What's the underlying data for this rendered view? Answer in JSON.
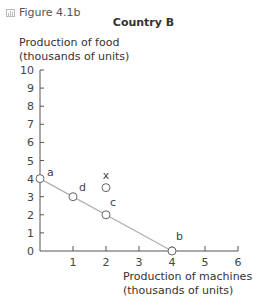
{
  "figure": {
    "label": "Figure 4.1b",
    "icon": "chart-icon"
  },
  "chart_data": {
    "type": "line",
    "title": "Country B",
    "ylabel": "Production of food\n(thousands of units)",
    "ylabel_lines": [
      "Production of food",
      "(thousands of units)"
    ],
    "xlabel": "Production of machines\n(thousands of units)",
    "xlabel_lines": [
      "Production of machines",
      "(thousands of units)"
    ],
    "xlim": [
      0,
      6
    ],
    "ylim": [
      0,
      10
    ],
    "xticks": [
      1,
      2,
      3,
      4,
      5,
      6
    ],
    "yticks": [
      0,
      1,
      2,
      3,
      4,
      5,
      6,
      7,
      8,
      9,
      10
    ],
    "grid": false,
    "series": [
      {
        "name": "Production possibility frontier",
        "x": [
          0,
          4
        ],
        "y": [
          4,
          0
        ]
      }
    ],
    "points": [
      {
        "label": "a",
        "x": 0,
        "y": 4
      },
      {
        "label": "d",
        "x": 1,
        "y": 3
      },
      {
        "label": "c",
        "x": 2,
        "y": 2
      },
      {
        "label": "b",
        "x": 4,
        "y": 0
      },
      {
        "label": "x",
        "x": 2,
        "y": 3.5
      }
    ],
    "colors": {
      "line": "#b0b0b0",
      "marker_fill": "#ffffff",
      "marker_stroke": "#666666",
      "axis": "#555555"
    }
  }
}
